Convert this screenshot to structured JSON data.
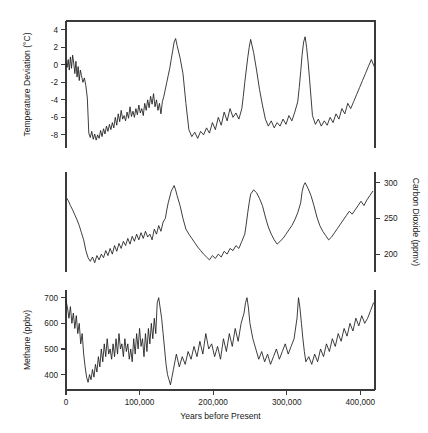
{
  "figure": {
    "xlabel": "Years before Present",
    "xticklabels": [
      "0",
      "100,000",
      "200,000",
      "300,000",
      "400,000"
    ],
    "xticks": [
      0,
      100000,
      200000,
      300000,
      400000
    ],
    "xlim": [
      0,
      420000
    ]
  },
  "panels": {
    "temperature": {
      "ylabel": "Temperature Deviation (°C)",
      "yticklabels": [
        "4",
        "2",
        "0",
        "-2",
        "-4",
        "-6",
        "-8"
      ],
      "yticks": [
        4,
        2,
        0,
        -2,
        -4,
        -6,
        -8
      ],
      "ylim": [
        -9.5,
        5
      ]
    },
    "co2": {
      "ylabel": "Carbon Dioxide (ppmv)",
      "yticklabels": [
        "300",
        "250",
        "200"
      ],
      "yticks": [
        300,
        250,
        200
      ],
      "ylim": [
        175,
        315
      ],
      "axis_side": "right"
    },
    "methane": {
      "ylabel": "Methane (ppbv)",
      "yticklabels": [
        "700",
        "600",
        "500",
        "400"
      ],
      "yticks": [
        700,
        600,
        500,
        400
      ],
      "ylim": [
        340,
        730
      ]
    }
  },
  "colors": {
    "line": "#1b1b1b",
    "axis": "#3a3a3a",
    "background": "#ffffff"
  },
  "chart_data": {
    "type": "line",
    "title": "",
    "xlabel": "Years before Present",
    "xlim": [
      0,
      420000
    ],
    "grid": false,
    "legend": "none",
    "panels": [
      {
        "name": "temperature",
        "ylabel": "Temperature Deviation (°C)",
        "ylim": [
          -9.5,
          5
        ],
        "yticks": [
          4,
          2,
          0,
          -2,
          -4,
          -6,
          -8
        ],
        "x": [
          0,
          1500,
          3000,
          4500,
          6000,
          7500,
          9000,
          10500,
          12000,
          13500,
          15000,
          16500,
          18000,
          19500,
          21000,
          23000,
          25000,
          27000,
          29000,
          31000,
          33000,
          35000,
          37000,
          39000,
          41000,
          43000,
          45000,
          47000,
          49000,
          51000,
          53000,
          55000,
          57000,
          59000,
          61000,
          63000,
          65000,
          67000,
          69000,
          71000,
          73000,
          75000,
          77000,
          79000,
          81000,
          83000,
          85000,
          87000,
          89000,
          91000,
          93000,
          95000,
          97000,
          99000,
          101000,
          103000,
          105000,
          107000,
          109000,
          111000,
          113000,
          115000,
          117000,
          119000,
          121000,
          123000,
          125000,
          127000,
          129000,
          131000,
          133000,
          135000,
          137000,
          139000,
          141000,
          143000,
          145000,
          147000,
          149000,
          151000,
          155000,
          159000,
          163000,
          167000,
          171000,
          175000,
          179000,
          183000,
          187000,
          191000,
          195000,
          199000,
          203000,
          207000,
          211000,
          215000,
          219000,
          223000,
          227000,
          231000,
          235000,
          239000,
          241000,
          243000,
          245000,
          247000,
          249000,
          251000,
          255000,
          259000,
          263000,
          267000,
          271000,
          275000,
          279000,
          283000,
          287000,
          291000,
          295000,
          299000,
          303000,
          307000,
          311000,
          315000,
          317000,
          319000,
          321000,
          323000,
          325000,
          327000,
          329000,
          331000,
          335000,
          339000,
          343000,
          347000,
          351000,
          355000,
          359000,
          363000,
          367000,
          371000,
          375000,
          379000,
          383000,
          387000,
          391000,
          395000,
          399000,
          403000,
          407000,
          411000,
          415000,
          419000
        ],
        "y": [
          0.2,
          -0.3,
          0.6,
          -0.6,
          0.9,
          -0.4,
          1.1,
          0.2,
          -1.0,
          0.4,
          -1.4,
          -0.2,
          -1.8,
          -0.6,
          -1.2,
          -2.0,
          -1.5,
          -2.4,
          -3.8,
          -7.8,
          -8.3,
          -7.6,
          -8.5,
          -7.9,
          -8.6,
          -8.0,
          -8.4,
          -7.5,
          -8.2,
          -7.3,
          -7.9,
          -7.0,
          -7.6,
          -6.8,
          -7.4,
          -6.6,
          -7.2,
          -6.0,
          -6.9,
          -5.6,
          -6.5,
          -5.2,
          -6.2,
          -5.8,
          -6.4,
          -5.4,
          -6.1,
          -4.8,
          -5.9,
          -5.3,
          -6.0,
          -5.0,
          -5.7,
          -4.6,
          -5.5,
          -5.0,
          -5.8,
          -4.4,
          -5.2,
          -4.0,
          -4.9,
          -3.6,
          -4.5,
          -3.3,
          -4.8,
          -4.0,
          -5.2,
          -4.4,
          -5.6,
          -4.2,
          -3.6,
          -2.8,
          -2.0,
          -1.2,
          -0.4,
          0.6,
          1.6,
          2.6,
          3.0,
          2.2,
          0.8,
          -1.0,
          -4.4,
          -7.4,
          -8.2,
          -7.7,
          -8.4,
          -7.6,
          -8.0,
          -7.2,
          -7.8,
          -6.6,
          -7.4,
          -6.0,
          -6.9,
          -5.4,
          -6.4,
          -5.0,
          -6.0,
          -5.5,
          -6.2,
          -5.0,
          -3.6,
          -2.0,
          -0.6,
          0.8,
          2.0,
          2.9,
          1.4,
          -0.6,
          -2.8,
          -4.6,
          -6.2,
          -7.0,
          -6.4,
          -7.2,
          -6.6,
          -7.0,
          -6.2,
          -6.8,
          -5.8,
          -6.4,
          -5.4,
          -4.2,
          -2.6,
          -0.8,
          1.2,
          2.6,
          3.2,
          2.0,
          0.4,
          -1.6,
          -5.8,
          -6.8,
          -6.2,
          -7.0,
          -6.4,
          -6.9,
          -6.0,
          -6.6,
          -5.6,
          -6.2,
          -5.0,
          -5.6,
          -4.4,
          -5.0,
          -4.2,
          -3.4,
          -2.6,
          -1.8,
          -1.0,
          -0.2,
          0.6,
          -0.2,
          0.4
        ]
      },
      {
        "name": "co2",
        "ylabel": "Carbon Dioxide (ppmv)",
        "ylim": [
          175,
          315
        ],
        "yticks": [
          300,
          250,
          200
        ],
        "axis_side": "right",
        "x": [
          0,
          3000,
          6000,
          9000,
          12000,
          15000,
          18000,
          21000,
          24000,
          27000,
          30000,
          33000,
          36000,
          39000,
          42000,
          45000,
          48000,
          51000,
          54000,
          57000,
          60000,
          63000,
          66000,
          69000,
          72000,
          75000,
          78000,
          81000,
          84000,
          87000,
          90000,
          93000,
          96000,
          99000,
          102000,
          105000,
          108000,
          111000,
          114000,
          117000,
          120000,
          123000,
          126000,
          129000,
          132000,
          135000,
          137000,
          139000,
          141000,
          143000,
          145000,
          147000,
          149000,
          151000,
          155000,
          159000,
          163000,
          167000,
          171000,
          175000,
          179000,
          183000,
          187000,
          191000,
          195000,
          199000,
          203000,
          207000,
          211000,
          215000,
          219000,
          223000,
          227000,
          231000,
          235000,
          239000,
          243000,
          245000,
          247000,
          249000,
          251000,
          255000,
          259000,
          263000,
          267000,
          271000,
          275000,
          279000,
          283000,
          287000,
          291000,
          295000,
          299000,
          303000,
          307000,
          311000,
          315000,
          319000,
          321000,
          323000,
          325000,
          329000,
          333000,
          337000,
          341000,
          345000,
          349000,
          353000,
          357000,
          361000,
          365000,
          369000,
          373000,
          377000,
          381000,
          385000,
          389000,
          393000,
          397000,
          401000,
          405000,
          409000,
          413000,
          417000,
          420000
        ],
        "y": [
          280,
          275,
          268,
          262,
          255,
          248,
          240,
          230,
          220,
          205,
          195,
          190,
          196,
          188,
          198,
          192,
          200,
          195,
          205,
          198,
          208,
          200,
          212,
          204,
          215,
          208,
          218,
          212,
          222,
          214,
          225,
          218,
          228,
          220,
          230,
          222,
          232,
          224,
          228,
          220,
          235,
          228,
          240,
          232,
          245,
          250,
          262,
          272,
          280,
          288,
          292,
          296,
          290,
          282,
          268,
          250,
          235,
          228,
          222,
          216,
          210,
          205,
          200,
          196,
          192,
          198,
          194,
          200,
          196,
          204,
          200,
          208,
          205,
          212,
          208,
          218,
          228,
          242,
          258,
          272,
          284,
          290,
          286,
          278,
          268,
          252,
          238,
          228,
          220,
          214,
          218,
          222,
          228,
          234,
          240,
          248,
          258,
          272,
          288,
          296,
          300,
          292,
          282,
          268,
          252,
          240,
          232,
          226,
          220,
          224,
          230,
          236,
          242,
          248,
          254,
          260,
          256,
          262,
          268,
          274,
          268,
          276,
          282,
          288
        ]
      },
      {
        "name": "methane",
        "ylabel": "Methane (ppbv)",
        "ylim": [
          340,
          730
        ],
        "yticks": [
          700,
          600,
          500,
          400
        ],
        "x": [
          0,
          2000,
          4000,
          6000,
          8000,
          10000,
          12000,
          14000,
          16000,
          18000,
          20000,
          22000,
          24000,
          26000,
          28000,
          30000,
          32000,
          34000,
          36000,
          38000,
          40000,
          42000,
          44000,
          46000,
          48000,
          50000,
          52000,
          54000,
          56000,
          58000,
          60000,
          62000,
          64000,
          66000,
          68000,
          70000,
          72000,
          74000,
          76000,
          78000,
          80000,
          82000,
          84000,
          86000,
          88000,
          90000,
          92000,
          94000,
          96000,
          98000,
          100000,
          102000,
          104000,
          106000,
          108000,
          110000,
          112000,
          114000,
          116000,
          118000,
          120000,
          122000,
          124000,
          126000,
          128000,
          130000,
          132000,
          134000,
          136000,
          138000,
          140000,
          142000,
          144000,
          146000,
          148000,
          150000,
          154000,
          158000,
          162000,
          166000,
          170000,
          174000,
          178000,
          182000,
          186000,
          190000,
          194000,
          198000,
          202000,
          206000,
          210000,
          214000,
          218000,
          222000,
          226000,
          230000,
          234000,
          238000,
          242000,
          244000,
          246000,
          248000,
          250000,
          254000,
          258000,
          262000,
          266000,
          270000,
          274000,
          278000,
          282000,
          286000,
          290000,
          294000,
          298000,
          302000,
          306000,
          310000,
          314000,
          316000,
          318000,
          320000,
          322000,
          324000,
          326000,
          330000,
          334000,
          338000,
          342000,
          346000,
          350000,
          354000,
          358000,
          362000,
          366000,
          370000,
          374000,
          378000,
          382000,
          386000,
          390000,
          394000,
          398000,
          402000,
          406000,
          410000,
          414000,
          418000
        ],
        "y": [
          690,
          660,
          620,
          665,
          600,
          640,
          580,
          630,
          560,
          600,
          520,
          560,
          480,
          430,
          390,
          370,
          400,
          380,
          420,
          390,
          440,
          410,
          470,
          430,
          500,
          450,
          520,
          470,
          540,
          480,
          500,
          460,
          520,
          470,
          540,
          480,
          560,
          500,
          520,
          470,
          540,
          490,
          520,
          460,
          500,
          450,
          540,
          480,
          560,
          500,
          580,
          510,
          540,
          470,
          560,
          490,
          580,
          520,
          600,
          540,
          620,
          560,
          680,
          700,
          660,
          620,
          560,
          500,
          440,
          400,
          380,
          360,
          390,
          420,
          450,
          480,
          430,
          470,
          440,
          490,
          460,
          510,
          470,
          530,
          480,
          560,
          500,
          520,
          470,
          510,
          460,
          540,
          490,
          560,
          510,
          580,
          530,
          600,
          640,
          680,
          700,
          660,
          600,
          540,
          500,
          460,
          490,
          450,
          480,
          440,
          470,
          500,
          460,
          490,
          520,
          480,
          510,
          540,
          620,
          700,
          660,
          600,
          540,
          490,
          450,
          470,
          440,
          480,
          450,
          500,
          470,
          520,
          490,
          540,
          510,
          560,
          530,
          580,
          550,
          600,
          570,
          620,
          590,
          630,
          600,
          620,
          650,
          680
        ]
      }
    ]
  }
}
